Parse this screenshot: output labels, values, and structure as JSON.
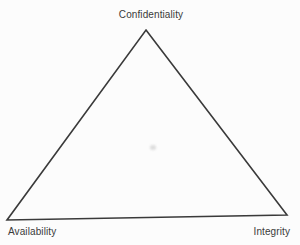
{
  "diagram": {
    "type": "triangle",
    "vertices": [
      {
        "position": "top",
        "label": "Confidentiality"
      },
      {
        "position": "bottom-left",
        "label": "Availability"
      },
      {
        "position": "bottom-right",
        "label": "Integrity"
      }
    ],
    "colors": {
      "line": "#3a3a3a",
      "text": "#3a3a3a",
      "background": "#fcfcfc"
    }
  }
}
